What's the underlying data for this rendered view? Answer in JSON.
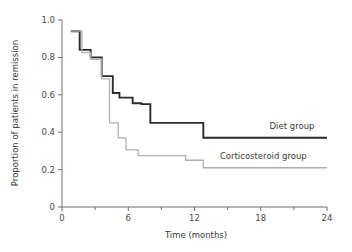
{
  "chart_data": {
    "type": "line",
    "title": "",
    "xlabel": "Time (months)",
    "ylabel": "Proportion of patients in remission",
    "xlim": [
      0,
      24
    ],
    "ylim": [
      0,
      1.0
    ],
    "grid": false,
    "legend_position": "inline-right",
    "x_ticks_major": [
      0,
      6,
      12,
      18,
      24
    ],
    "x_tick_labels": [
      "0",
      "6",
      "12",
      "18",
      "24"
    ],
    "x_ticks_minor": [
      3,
      9,
      15,
      21
    ],
    "y_ticks": [
      0,
      0.2,
      0.4,
      0.6,
      0.8,
      1.0
    ],
    "y_tick_labels": [
      "0",
      "0.2",
      "0.4",
      "0.6",
      "0.8",
      "1.0"
    ],
    "series": [
      {
        "name": "Diet group",
        "color": "#2b2b2b",
        "line_width": 1.9,
        "step": "post",
        "x": [
          0.8,
          1.6,
          2.6,
          3.6,
          4.6,
          5.2,
          6.4,
          7.2,
          8.0,
          12.8,
          24.0
        ],
        "values": [
          0.94,
          0.84,
          0.8,
          0.7,
          0.61,
          0.585,
          0.555,
          0.55,
          0.45,
          0.37,
          0.37
        ]
      },
      {
        "name": "Corticosteroid group",
        "color": "#b0b0b0",
        "line_width": 1.3,
        "step": "post",
        "x": [
          0.8,
          1.8,
          2.6,
          3.6,
          4.3,
          5.1,
          5.8,
          6.9,
          11.2,
          12.8,
          24.0
        ],
        "values": [
          0.94,
          0.825,
          0.79,
          0.685,
          0.45,
          0.37,
          0.305,
          0.275,
          0.25,
          0.21,
          0.21
        ]
      }
    ],
    "annotations": [
      {
        "text": "Diet group",
        "x": 18.8,
        "y": 0.415
      },
      {
        "text": "Corticosteroid group",
        "x": 14.3,
        "y": 0.255
      }
    ]
  }
}
